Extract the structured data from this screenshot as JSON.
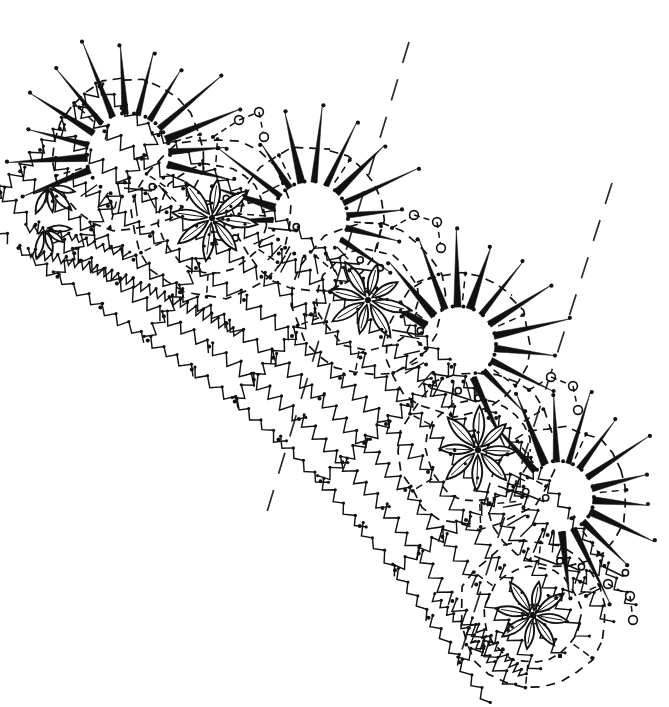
{
  "document": {
    "title": "Crochet Lace Pattern Diagram",
    "kind": "line-art-diagram",
    "caption": "",
    "width": 669,
    "height": 707,
    "background_color": "#ffffff",
    "ink_color": "#111111"
  },
  "chart_data": {
    "type": "diagram",
    "title": "Crochet Lace Pattern Diagram",
    "subtitle": "",
    "xlabel": "",
    "ylabel": "",
    "grid": false,
    "legend": "none",
    "stroke_style": "hand-drawn ink on white",
    "motif_counts": {
      "starburst_medallions": 4,
      "flower_medallions": 4,
      "picot_circle_chains": 4,
      "guide_lines": 2
    },
    "motifs": [
      {
        "id": "starburst-1",
        "type": "starburst",
        "label": "Spiked starburst medallion",
        "cx": 128,
        "cy": 155,
        "radius": 42,
        "spikes": 13,
        "spike_length": 78,
        "rotation": -94
      },
      {
        "id": "flower-1",
        "type": "flower",
        "label": "Eight-petal flower medallion",
        "cx": 212,
        "cy": 218,
        "radius": 54,
        "petals": 8,
        "petal_length": 42,
        "rotation": 8
      },
      {
        "id": "starburst-2",
        "type": "starburst",
        "label": "Spiked starburst medallion",
        "cx": 310,
        "cy": 219,
        "radius": 38,
        "spikes": 12,
        "spike_length": 74,
        "rotation": -74
      },
      {
        "id": "flower-2",
        "type": "flower",
        "label": "Eight-petal flower medallion",
        "cx": 368,
        "cy": 300,
        "radius": 50,
        "petals": 8,
        "petal_length": 40,
        "rotation": 14
      },
      {
        "id": "starburst-3",
        "type": "starburst",
        "label": "Spiked starburst medallion",
        "cx": 458,
        "cy": 344,
        "radius": 38,
        "spikes": 12,
        "spike_length": 76,
        "rotation": -42
      },
      {
        "id": "flower-3",
        "type": "flower",
        "label": "Eight-petal flower medallion",
        "cx": 478,
        "cy": 450,
        "radius": 52,
        "petals": 8,
        "petal_length": 41,
        "rotation": 2
      },
      {
        "id": "starburst-4",
        "type": "starburst",
        "label": "Spiked starburst medallion",
        "cx": 558,
        "cy": 497,
        "radius": 36,
        "spikes": 12,
        "spike_length": 76,
        "rotation": -24
      },
      {
        "id": "flower-4",
        "type": "flower",
        "label": "Eight-petal flower medallion",
        "cx": 533,
        "cy": 615,
        "radius": 48,
        "petals": 8,
        "petal_length": 39,
        "rotation": 10
      },
      {
        "id": "flower-edge-a",
        "type": "flower-partial",
        "label": "Partial edge flower",
        "cx": 48,
        "cy": 186,
        "radius": 34,
        "petals": 4,
        "petal_length": 32,
        "rotation": 30
      },
      {
        "id": "flower-edge-b",
        "type": "flower-partial",
        "label": "Partial edge flower",
        "cx": 44,
        "cy": 228,
        "radius": 32,
        "petals": 4,
        "petal_length": 30,
        "rotation": 20
      }
    ],
    "picot_chains": [
      {
        "id": "picot-chain-1",
        "circles": [
          [
            239,
            120
          ],
          [
            259,
            112
          ],
          [
            264,
            137
          ]
        ],
        "anchor": [
          213,
          137
        ]
      },
      {
        "id": "picot-chain-2",
        "circles": [
          [
            414,
            215
          ],
          [
            437,
            222
          ],
          [
            441,
            248
          ]
        ],
        "anchor": [
          392,
          228
        ]
      },
      {
        "id": "picot-chain-3",
        "circles": [
          [
            551,
            377
          ],
          [
            573,
            386
          ],
          [
            578,
            410
          ]
        ],
        "anchor": [
          529,
          390
        ]
      },
      {
        "id": "picot-chain-4",
        "circles": [
          [
            608,
            584
          ],
          [
            630,
            596
          ],
          [
            633,
            620
          ]
        ],
        "anchor": [
          586,
          596
        ]
      }
    ],
    "guide_lines": [
      {
        "id": "guide-line-upper",
        "x1": 409,
        "y1": 42,
        "x2": 267,
        "y2": 512,
        "dash": "22 17"
      },
      {
        "id": "guide-line-lower",
        "x1": 612,
        "y1": 183,
        "x2": 458,
        "y2": 662,
        "dash": "22 17"
      }
    ],
    "band_path": {
      "description": "Curved diagonal band of medallions",
      "start": [
        40,
        150
      ],
      "end": [
        610,
        660
      ],
      "curvature": "convex toward lower-left"
    },
    "symbols": [
      {
        "name": "chain-stitch-zigzag",
        "meaning": "chain stitch row",
        "count": 34
      },
      {
        "name": "picot-circle",
        "meaning": "picot loop",
        "count": 12
      },
      {
        "name": "spike-stitch",
        "meaning": "long treble / spike",
        "count": 49
      },
      {
        "name": "petal-leaf",
        "meaning": "leaf / petal cluster",
        "count": 40
      },
      {
        "name": "flag-symbol",
        "meaning": "slip stitch with loop",
        "count": 14
      },
      {
        "name": "dot-node",
        "meaning": "single chain / node",
        "count": 400
      }
    ]
  }
}
